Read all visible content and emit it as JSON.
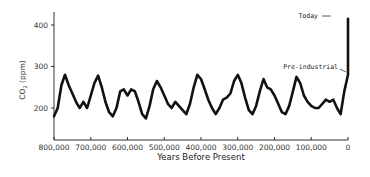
{
  "chart_data": {
    "type": "line",
    "title": "",
    "xlabel": "Years Before Present",
    "ylabel": "CO2 (ppm)",
    "xlim": [
      800000,
      0
    ],
    "ylim": [
      150,
      430
    ],
    "x_ticks": [
      "800,000",
      "700,000",
      "600,000",
      "500,000",
      "400,000",
      "300,000",
      "200,000",
      "100,000",
      "0"
    ],
    "y_ticks": [
      "200",
      "300",
      "400"
    ],
    "grid": false,
    "legend": null,
    "annotations": [
      {
        "text": "Today",
        "x": 0,
        "y": 415
      },
      {
        "text": "Pre-industrial",
        "x": 0,
        "y": 280
      }
    ],
    "series": [
      {
        "name": "CO2",
        "x": [
          800000,
          790000,
          780000,
          770000,
          760000,
          750000,
          740000,
          730000,
          720000,
          710000,
          700000,
          690000,
          680000,
          670000,
          660000,
          650000,
          640000,
          630000,
          620000,
          610000,
          600000,
          590000,
          580000,
          570000,
          560000,
          550000,
          540000,
          530000,
          520000,
          510000,
          500000,
          490000,
          480000,
          470000,
          460000,
          450000,
          440000,
          430000,
          420000,
          410000,
          400000,
          390000,
          380000,
          370000,
          360000,
          350000,
          340000,
          330000,
          320000,
          310000,
          300000,
          290000,
          280000,
          270000,
          260000,
          250000,
          240000,
          230000,
          220000,
          210000,
          200000,
          190000,
          180000,
          170000,
          160000,
          150000,
          140000,
          130000,
          120000,
          110000,
          100000,
          90000,
          80000,
          70000,
          60000,
          50000,
          40000,
          30000,
          20000,
          10000,
          0,
          0
        ],
        "values": [
          180,
          200,
          255,
          280,
          255,
          235,
          215,
          200,
          215,
          200,
          230,
          260,
          278,
          250,
          215,
          190,
          180,
          200,
          240,
          245,
          230,
          245,
          240,
          215,
          185,
          175,
          205,
          245,
          265,
          250,
          230,
          210,
          200,
          215,
          205,
          195,
          185,
          210,
          250,
          280,
          270,
          245,
          220,
          200,
          185,
          200,
          220,
          225,
          235,
          265,
          280,
          260,
          225,
          195,
          185,
          205,
          240,
          270,
          250,
          245,
          230,
          210,
          190,
          185,
          205,
          240,
          275,
          260,
          230,
          215,
          205,
          200,
          200,
          210,
          220,
          215,
          220,
          200,
          185,
          240,
          280,
          415
        ]
      }
    ]
  }
}
